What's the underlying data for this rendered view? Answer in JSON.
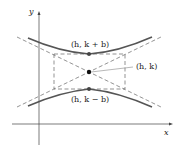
{
  "diagram": {
    "type": "hyperbola-vertical",
    "axes": {
      "x_label": "x",
      "y_label": "y"
    },
    "labels": {
      "upper_vertex": "(h, k + b)",
      "center": "(h, k)",
      "lower_vertex": "(h, k − b)"
    },
    "colors": {
      "curve": "#555555",
      "asymptote": "#666666",
      "point": "#111111",
      "axis": "#444444"
    }
  }
}
